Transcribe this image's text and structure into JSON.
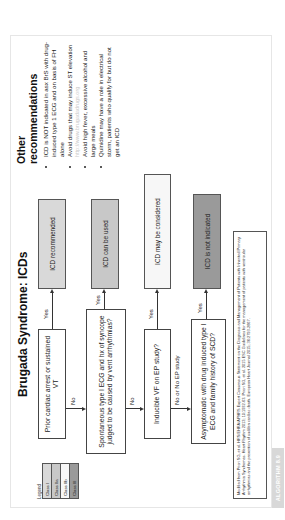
{
  "title": "Brugada Syndrome: ICDs",
  "colors": {
    "class_i": "#d9d9d9",
    "class_iia": "#c8c8c8",
    "class_iib": "#f7f7f7",
    "class_iii": "#9a9a9a"
  },
  "legend": {
    "title": "Legend",
    "items": [
      "Class I",
      "Class IIa",
      "Class IIb",
      "Class III"
    ]
  },
  "decisions": [
    "Prior cardiac arrest or sustained VT",
    "Spontaneous type I ECG and hx of syncope judged to be caused by vent arrhythmias?",
    "Inducible VF on EP study?",
    "Asymptomatic with drug induced type I ECG and family history of SCD?"
  ],
  "outcomes": [
    "ICD recommended",
    "ICD can be used",
    "ICD may be considered",
    "ICD is not indicated"
  ],
  "edge_labels": {
    "yes": "Yes",
    "no": "No",
    "no_or_no_ep": "No or No EP study"
  },
  "citation": "Modified from Priori SG, et al. HRS/EHRA/APHRS Expert Consensus Statement on the Diagnosis and Management of Patients with Inherited Primary Arrhythmia Syndromes. Heart Rhythm 2013; 10:1932-63. Priori SG, et al. 2015 ESC Guidelines for the management of patients with ventricular arrhythmias and the prevention of sudden cardiac death. European Heart Journal 2015; 36:2793-2867.",
  "recommendations": {
    "title_line1": "Other",
    "title_line2": "recommendations",
    "items": [
      "ICD is NOT indicated in asx BrS with drug-induced type 1 ECG and on basis of FH alone",
      "Avoid drugs that may induce ST elevation",
      "Avoid high fever, excessive alcohol and large meals",
      "Quinidine may have a role in electrical storm, patients who qualify for but do not get an ICD"
    ],
    "watermark": "http://www.brugadadrugs.org"
  },
  "tag": "ALGORITHM 8.9"
}
